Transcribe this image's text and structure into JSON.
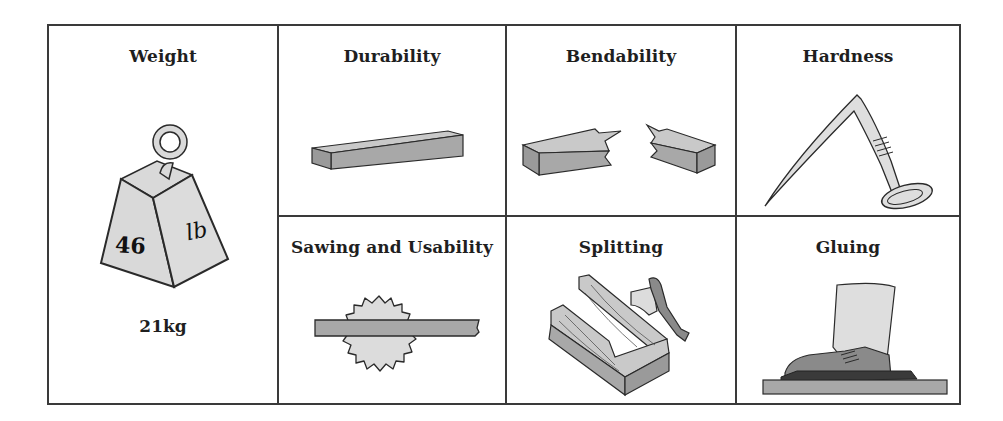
{
  "figure": {
    "cells": [
      {
        "id": "weight",
        "title": "Weight",
        "illustration": "weight-icon",
        "weight_label_number": "46",
        "weight_label_unit": "lb",
        "caption": "21kg"
      },
      {
        "id": "durability",
        "title": "Durability",
        "illustration": "wooden-plank-icon"
      },
      {
        "id": "bendability",
        "title": "Bendability",
        "illustration": "broken-plank-icon"
      },
      {
        "id": "hardness",
        "title": "Hardness",
        "illustration": "bent-nail-icon"
      },
      {
        "id": "sawing",
        "title": "Sawing and Usability",
        "illustration": "saw-blade-plank-icon"
      },
      {
        "id": "splitting",
        "title": "Splitting",
        "illustration": "split-log-axe-icon"
      },
      {
        "id": "gluing",
        "title": "Gluing",
        "illustration": "foot-pressing-board-icon"
      }
    ],
    "colors": {
      "border": "#3a3a3a",
      "fill_light": "#d9d9d9",
      "fill_mid": "#a8a8a8",
      "fill_dark": "#8a8a8a",
      "outline": "#2a2a2a"
    }
  }
}
